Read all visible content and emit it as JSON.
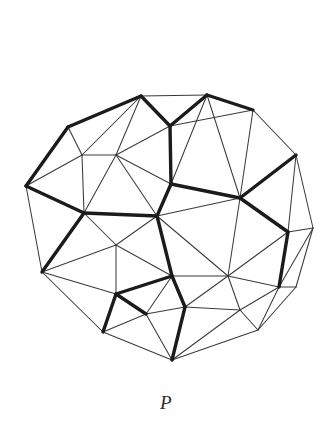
{
  "figure": {
    "caption": "P",
    "colors": {
      "background": "#ffffff",
      "thin_edge": "#3a3a3c",
      "bold_edge": "#1b1b1d",
      "caption": "#2b2b2d"
    },
    "graph_data": {
      "type": "diagram",
      "description": "Triangulated planar graph drawn as a roughly circular disc; a subset of edges is drawn with heavy stroke weight forming a highlighted subgraph.",
      "vertex_count": 28,
      "edge_count": 69,
      "bold_edge_count": 24,
      "vertices": [
        {
          "id": "v0",
          "x": 141,
          "y": 96
        },
        {
          "id": "v1",
          "x": 207,
          "y": 95
        },
        {
          "id": "v2",
          "x": 253,
          "y": 110
        },
        {
          "id": "v3",
          "x": 296,
          "y": 155
        },
        {
          "id": "v4",
          "x": 313,
          "y": 228
        },
        {
          "id": "v5",
          "x": 296,
          "y": 287
        },
        {
          "id": "v6",
          "x": 258,
          "y": 330
        },
        {
          "id": "v7",
          "x": 172,
          "y": 360
        },
        {
          "id": "v8",
          "x": 103,
          "y": 332
        },
        {
          "id": "v9",
          "x": 42,
          "y": 272
        },
        {
          "id": "v10",
          "x": 26,
          "y": 186
        },
        {
          "id": "v11",
          "x": 68,
          "y": 127
        },
        {
          "id": "v12",
          "x": 82,
          "y": 155
        },
        {
          "id": "v13",
          "x": 116,
          "y": 155
        },
        {
          "id": "v14",
          "x": 170,
          "y": 126
        },
        {
          "id": "v15",
          "x": 171,
          "y": 184
        },
        {
          "id": "v16",
          "x": 84,
          "y": 213
        },
        {
          "id": "v17",
          "x": 116,
          "y": 245
        },
        {
          "id": "v18",
          "x": 157,
          "y": 216
        },
        {
          "id": "v19",
          "x": 240,
          "y": 198
        },
        {
          "id": "v20",
          "x": 228,
          "y": 276
        },
        {
          "id": "v21",
          "x": 172,
          "y": 276
        },
        {
          "id": "v22",
          "x": 116,
          "y": 294
        },
        {
          "id": "v23",
          "x": 185,
          "y": 307
        },
        {
          "id": "v24",
          "x": 240,
          "y": 310
        },
        {
          "id": "v25",
          "x": 146,
          "y": 314
        },
        {
          "id": "v26",
          "x": 288,
          "y": 232
        },
        {
          "id": "v27",
          "x": 279,
          "y": 287
        }
      ],
      "edges": [
        {
          "from": "v0",
          "to": "v1",
          "bold": false
        },
        {
          "from": "v1",
          "to": "v2",
          "bold": true
        },
        {
          "from": "v2",
          "to": "v3",
          "bold": false
        },
        {
          "from": "v3",
          "to": "v4",
          "bold": false
        },
        {
          "from": "v4",
          "to": "v5",
          "bold": false
        },
        {
          "from": "v5",
          "to": "v6",
          "bold": false
        },
        {
          "from": "v6",
          "to": "v7",
          "bold": false
        },
        {
          "from": "v7",
          "to": "v8",
          "bold": false
        },
        {
          "from": "v8",
          "to": "v9",
          "bold": false
        },
        {
          "from": "v9",
          "to": "v10",
          "bold": false
        },
        {
          "from": "v10",
          "to": "v11",
          "bold": true
        },
        {
          "from": "v11",
          "to": "v0",
          "bold": true
        },
        {
          "from": "v0",
          "to": "v14",
          "bold": true
        },
        {
          "from": "v1",
          "to": "v14",
          "bold": true
        },
        {
          "from": "v0",
          "to": "v13",
          "bold": false
        },
        {
          "from": "v0",
          "to": "v12",
          "bold": false
        },
        {
          "from": "v11",
          "to": "v12",
          "bold": false
        },
        {
          "from": "v12",
          "to": "v13",
          "bold": false
        },
        {
          "from": "v13",
          "to": "v14",
          "bold": false
        },
        {
          "from": "v10",
          "to": "v12",
          "bold": false
        },
        {
          "from": "v10",
          "to": "v16",
          "bold": true
        },
        {
          "from": "v12",
          "to": "v16",
          "bold": false
        },
        {
          "from": "v13",
          "to": "v16",
          "bold": false
        },
        {
          "from": "v13",
          "to": "v18",
          "bold": false
        },
        {
          "from": "v14",
          "to": "v15",
          "bold": true
        },
        {
          "from": "v15",
          "to": "v18",
          "bold": true
        },
        {
          "from": "v13",
          "to": "v15",
          "bold": false
        },
        {
          "from": "v16",
          "to": "v18",
          "bold": true
        },
        {
          "from": "v16",
          "to": "v17",
          "bold": false
        },
        {
          "from": "v17",
          "to": "v18",
          "bold": false
        },
        {
          "from": "v9",
          "to": "v16",
          "bold": true
        },
        {
          "from": "v9",
          "to": "v17",
          "bold": false
        },
        {
          "from": "v9",
          "to": "v22",
          "bold": false
        },
        {
          "from": "v17",
          "to": "v22",
          "bold": false
        },
        {
          "from": "v17",
          "to": "v21",
          "bold": false
        },
        {
          "from": "v18",
          "to": "v21",
          "bold": true
        },
        {
          "from": "v21",
          "to": "v22",
          "bold": true
        },
        {
          "from": "v22",
          "to": "v25",
          "bold": true
        },
        {
          "from": "v8",
          "to": "v22",
          "bold": true
        },
        {
          "from": "v8",
          "to": "v25",
          "bold": false
        },
        {
          "from": "v25",
          "to": "v21",
          "bold": false
        },
        {
          "from": "v21",
          "to": "v23",
          "bold": true
        },
        {
          "from": "v23",
          "to": "v25",
          "bold": false
        },
        {
          "from": "v7",
          "to": "v25",
          "bold": false
        },
        {
          "from": "v7",
          "to": "v23",
          "bold": true
        },
        {
          "from": "v1",
          "to": "v19",
          "bold": false
        },
        {
          "from": "v2",
          "to": "v19",
          "bold": false
        },
        {
          "from": "v3",
          "to": "v19",
          "bold": true
        },
        {
          "from": "v15",
          "to": "v19",
          "bold": true
        },
        {
          "from": "v15",
          "to": "v1",
          "bold": false
        },
        {
          "from": "v14",
          "to": "v2",
          "bold": false
        },
        {
          "from": "v19",
          "to": "v20",
          "bold": false
        },
        {
          "from": "v19",
          "to": "v26",
          "bold": true
        },
        {
          "from": "v26",
          "to": "v4",
          "bold": false
        },
        {
          "from": "v26",
          "to": "v3",
          "bold": false
        },
        {
          "from": "v26",
          "to": "v27",
          "bold": true
        },
        {
          "from": "v27",
          "to": "v5",
          "bold": false
        },
        {
          "from": "v27",
          "to": "v4",
          "bold": false
        },
        {
          "from": "v20",
          "to": "v26",
          "bold": false
        },
        {
          "from": "v20",
          "to": "v27",
          "bold": false
        },
        {
          "from": "v18",
          "to": "v20",
          "bold": false
        },
        {
          "from": "v18",
          "to": "v19",
          "bold": false
        },
        {
          "from": "v20",
          "to": "v21",
          "bold": false
        },
        {
          "from": "v20",
          "to": "v24",
          "bold": false
        },
        {
          "from": "v23",
          "to": "v24",
          "bold": false
        },
        {
          "from": "v23",
          "to": "v20",
          "bold": false
        },
        {
          "from": "v24",
          "to": "v27",
          "bold": false
        },
        {
          "from": "v24",
          "to": "v6",
          "bold": false
        },
        {
          "from": "v7",
          "to": "v24",
          "bold": false
        },
        {
          "from": "v6",
          "to": "v27",
          "bold": false
        }
      ]
    }
  }
}
